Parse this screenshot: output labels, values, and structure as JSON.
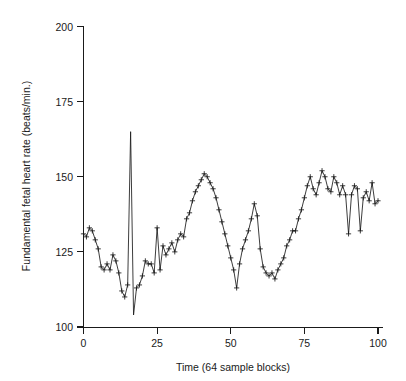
{
  "chart_data": {
    "type": "line",
    "title": "",
    "xlabel": "Time (64 sample blocks)",
    "ylabel": "Fundamental fetal heart rate (beats/min.)",
    "xlim": [
      0,
      102
    ],
    "ylim": [
      100,
      200
    ],
    "xticks": [
      0,
      25,
      50,
      75,
      100
    ],
    "xticklabels": [
      "0",
      "25",
      "50",
      "75",
      "100"
    ],
    "yticks": [
      100,
      125,
      150,
      175,
      200
    ],
    "yticklabels": [
      "100",
      "125",
      "150",
      "175",
      "200"
    ],
    "grid": false,
    "legend": false,
    "marker": "plus",
    "line_color": "#1a1a1a",
    "series": [
      {
        "name": "Fundamental fetal heart rate",
        "x": [
          0,
          1,
          2,
          3,
          4,
          5,
          6,
          7,
          8,
          9,
          10,
          11,
          12,
          13,
          14,
          15,
          16,
          17,
          18,
          19,
          20,
          21,
          22,
          23,
          24,
          25,
          26,
          27,
          28,
          29,
          30,
          31,
          32,
          33,
          34,
          35,
          36,
          37,
          38,
          39,
          40,
          41,
          42,
          43,
          44,
          45,
          46,
          47,
          48,
          49,
          50,
          51,
          52,
          53,
          54,
          55,
          56,
          57,
          58,
          59,
          60,
          61,
          62,
          63,
          64,
          65,
          66,
          67,
          68,
          69,
          70,
          71,
          72,
          73,
          74,
          75,
          76,
          77,
          78,
          79,
          80,
          81,
          82,
          83,
          84,
          85,
          86,
          87,
          88,
          89,
          90,
          91,
          92,
          93,
          94,
          95,
          96,
          97,
          98,
          99,
          100
        ],
        "y": [
          131,
          130,
          133,
          132,
          129,
          126,
          120,
          119,
          121,
          119,
          124,
          122,
          118,
          112,
          110,
          114,
          165,
          104,
          113,
          114,
          117,
          122,
          121,
          121,
          118,
          133,
          119,
          127,
          124,
          126,
          128,
          125,
          129,
          131,
          130,
          136,
          138,
          142,
          145,
          147,
          149,
          151,
          150,
          148,
          146,
          143,
          139,
          135,
          131,
          127,
          123,
          119,
          113,
          121,
          126,
          129,
          132,
          136,
          141,
          137,
          126,
          120,
          118,
          117,
          118,
          116,
          119,
          121,
          123,
          127,
          129,
          132,
          132,
          136,
          139,
          143,
          147,
          150,
          146,
          144,
          148,
          152,
          150,
          146,
          145,
          150,
          148,
          144,
          147,
          144,
          131,
          144,
          147,
          146,
          132,
          143,
          145,
          142,
          148,
          141,
          142
        ]
      }
    ]
  },
  "figure": {
    "background_color": "#ffffff",
    "foreground_color": "#1a1a1a"
  }
}
